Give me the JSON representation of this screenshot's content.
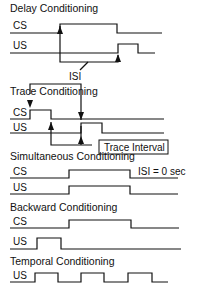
{
  "sections": {
    "delay": {
      "title": "Delay Conditioning",
      "cs": "CS",
      "us": "US",
      "isi": "ISI"
    },
    "trace": {
      "title": "Trace Conditioning",
      "cs": "CS",
      "us": "US",
      "trace_interval": "Trace Interval"
    },
    "simultaneous": {
      "title": "Simultaneous Conditioning",
      "cs": "CS",
      "us": "US",
      "isi_note": "ISI = 0 sec"
    },
    "backward": {
      "title": "Backward Conditioning",
      "cs": "CS",
      "us": "US"
    },
    "temporal": {
      "title": "Temporal Conditioning",
      "us": "US"
    }
  },
  "colors": {
    "line": "#111111",
    "background": "#ffffff"
  }
}
